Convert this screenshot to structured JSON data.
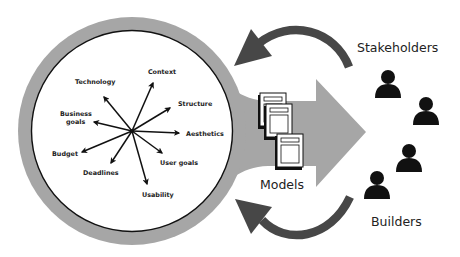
{
  "diagram": {
    "colors": {
      "ring": "#a6a6a6",
      "funnel": "#a6a6a6",
      "feedback_arrow": "#474747",
      "ink": "#111111",
      "background": "#ffffff"
    },
    "hub": {
      "factors": [
        {
          "label": "Context",
          "lines": [
            "Context"
          ]
        },
        {
          "label": "Structure",
          "lines": [
            "Structure"
          ]
        },
        {
          "label": "Aesthetics",
          "lines": [
            "Aesthetics"
          ]
        },
        {
          "label": "User goals",
          "lines": [
            "User goals"
          ]
        },
        {
          "label": "Usability",
          "lines": [
            "Usability"
          ]
        },
        {
          "label": "Deadlines",
          "lines": [
            "Deadlines"
          ]
        },
        {
          "label": "Budget",
          "lines": [
            "Budget"
          ]
        },
        {
          "label": "Business goals",
          "lines": [
            "Business",
            "goals"
          ]
        },
        {
          "label": "Technology",
          "lines": [
            "Technology"
          ]
        }
      ]
    },
    "output": {
      "label": "Models",
      "document_icons": 3
    },
    "audiences": {
      "stakeholders": {
        "label": "Stakeholders",
        "person_icons": 2
      },
      "builders": {
        "label": "Builders",
        "person_icons": 2
      }
    },
    "feedback_arrows": [
      {
        "from": "Stakeholders",
        "to": "hub"
      },
      {
        "from": "Builders",
        "to": "hub"
      }
    ]
  }
}
